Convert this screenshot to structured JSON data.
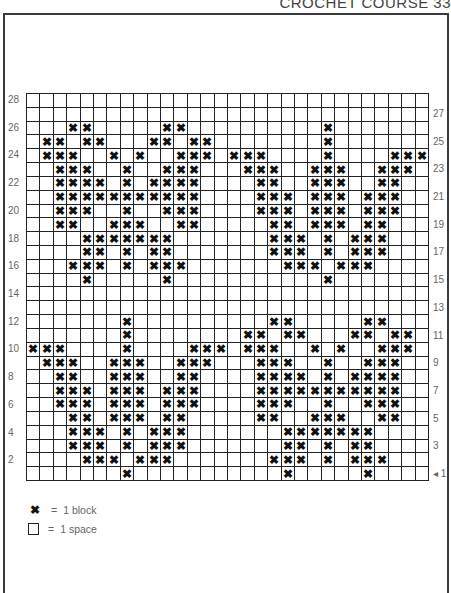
{
  "header": {
    "title": "CROCHET COURSE 33"
  },
  "chart": {
    "columns": 30,
    "rows": 28,
    "block_symbol": "✖",
    "row_labels_left": [
      28,
      26,
      24,
      22,
      20,
      18,
      16,
      14,
      12,
      10,
      8,
      6,
      4,
      2
    ],
    "row_labels_right": [
      27,
      25,
      23,
      21,
      19,
      17,
      15,
      13,
      11,
      9,
      7,
      5,
      3,
      1
    ],
    "start_marker": "◂",
    "start_row": 1,
    "blocks_by_row": {
      "28": [],
      "27": [],
      "26": [
        4,
        5,
        11,
        12,
        23
      ],
      "25": [
        2,
        3,
        5,
        6,
        10,
        11,
        13,
        14,
        23
      ],
      "24": [
        2,
        3,
        4,
        7,
        9,
        12,
        13,
        14,
        16,
        17,
        18,
        23,
        28,
        29,
        30
      ],
      "23": [
        3,
        4,
        5,
        8,
        11,
        12,
        13,
        17,
        18,
        19,
        22,
        23,
        24,
        27,
        28,
        29
      ],
      "22": [
        3,
        4,
        5,
        6,
        8,
        10,
        11,
        12,
        13,
        18,
        19,
        22,
        23,
        24,
        27,
        28
      ],
      "21": [
        3,
        4,
        5,
        6,
        7,
        8,
        9,
        10,
        11,
        12,
        13,
        18,
        19,
        20,
        22,
        23,
        24,
        26,
        27,
        28
      ],
      "20": [
        3,
        4,
        5,
        8,
        11,
        12,
        13,
        18,
        19,
        20,
        22,
        23,
        24,
        26,
        27,
        28
      ],
      "19": [
        3,
        4,
        7,
        8,
        9,
        12,
        13,
        19,
        20,
        22,
        23,
        24,
        26,
        27
      ],
      "18": [
        5,
        6,
        7,
        8,
        9,
        10,
        11,
        19,
        20,
        21,
        23,
        25,
        26,
        27
      ],
      "17": [
        5,
        6,
        8,
        10,
        11,
        19,
        20,
        21,
        23,
        25,
        26,
        27
      ],
      "16": [
        4,
        5,
        6,
        8,
        10,
        11,
        12,
        20,
        21,
        22,
        24,
        25,
        26
      ],
      "15": [
        5,
        11,
        23
      ],
      "14": [],
      "13": [],
      "12": [
        8,
        19,
        20,
        26,
        27
      ],
      "11": [
        8,
        17,
        18,
        20,
        21,
        25,
        26,
        28,
        29
      ],
      "10": [
        1,
        2,
        3,
        8,
        13,
        14,
        15,
        17,
        18,
        19,
        22,
        24,
        27,
        28,
        29
      ],
      "9": [
        2,
        3,
        4,
        7,
        8,
        9,
        12,
        13,
        14,
        18,
        19,
        20,
        23,
        26,
        27,
        28
      ],
      "8": [
        3,
        4,
        7,
        8,
        9,
        12,
        13,
        18,
        19,
        20,
        21,
        23,
        25,
        26,
        27,
        28
      ],
      "7": [
        3,
        4,
        5,
        7,
        8,
        9,
        11,
        12,
        13,
        18,
        19,
        20,
        21,
        22,
        23,
        24,
        25,
        26,
        27,
        28
      ],
      "6": [
        3,
        4,
        5,
        7,
        8,
        9,
        11,
        12,
        13,
        18,
        19,
        20,
        23,
        26,
        27,
        28
      ],
      "5": [
        4,
        5,
        7,
        8,
        9,
        11,
        12,
        18,
        19,
        22,
        23,
        24,
        27,
        28
      ],
      "4": [
        4,
        5,
        6,
        8,
        10,
        11,
        12,
        20,
        21,
        22,
        23,
        24,
        25,
        26
      ],
      "3": [
        4,
        5,
        6,
        8,
        10,
        11,
        12,
        20,
        21,
        23,
        25,
        26
      ],
      "2": [
        5,
        6,
        7,
        9,
        10,
        11,
        19,
        20,
        21,
        23,
        25,
        26,
        27
      ],
      "1": [
        8,
        20,
        26
      ]
    }
  },
  "legend": {
    "items": [
      {
        "symbol": "block-icon",
        "glyph": "✖",
        "equals": "=",
        "label": "1 block"
      },
      {
        "symbol": "space-icon",
        "glyph": "",
        "equals": "=",
        "label": "1 space"
      }
    ]
  }
}
